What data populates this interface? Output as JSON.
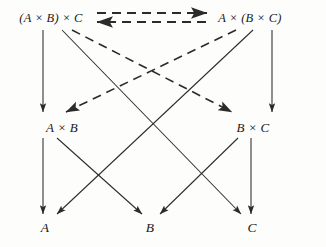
{
  "diagram": {
    "background_color": "#fdfdfc",
    "stroke_color": "#2b2b2b",
    "nodes": [
      {
        "id": "assoc-left",
        "label": "(A × B) × C",
        "x": 51,
        "y": 18
      },
      {
        "id": "assoc-right",
        "label": "A × (B × C)",
        "x": 250,
        "y": 18
      },
      {
        "id": "ab",
        "label": "A × B",
        "x": 45,
        "y": 126
      },
      {
        "id": "bc",
        "label": "B × C",
        "x": 250,
        "y": 126
      },
      {
        "id": "a",
        "label": "A",
        "x": 45,
        "y": 227
      },
      {
        "id": "b",
        "label": "B",
        "x": 150,
        "y": 227
      },
      {
        "id": "c",
        "label": "C",
        "x": 251,
        "y": 227
      }
    ],
    "edges": [
      {
        "id": "iso-forward",
        "from": "assoc-left",
        "to": "assoc-right",
        "style": "dashed",
        "arrow": "end"
      },
      {
        "id": "iso-backward",
        "from": "assoc-right",
        "to": "assoc-left",
        "style": "dashed",
        "arrow": "end"
      },
      {
        "id": "left-to-ab",
        "from": "assoc-left",
        "to": "ab",
        "style": "solid",
        "arrow": "end"
      },
      {
        "id": "right-to-bc",
        "from": "assoc-right",
        "to": "bc",
        "style": "solid",
        "arrow": "end"
      },
      {
        "id": "left-to-c",
        "from": "assoc-left",
        "to": "c",
        "style": "solid",
        "arrow": "end"
      },
      {
        "id": "right-to-a",
        "from": "assoc-right",
        "to": "a",
        "style": "solid",
        "arrow": "end"
      },
      {
        "id": "left-to-bc",
        "from": "assoc-left",
        "to": "bc",
        "style": "dashed",
        "arrow": "end"
      },
      {
        "id": "right-to-ab",
        "from": "assoc-right",
        "to": "ab",
        "style": "dashed",
        "arrow": "end"
      },
      {
        "id": "ab-to-a",
        "from": "ab",
        "to": "a",
        "style": "solid",
        "arrow": "end"
      },
      {
        "id": "ab-to-b",
        "from": "ab",
        "to": "b",
        "style": "solid",
        "arrow": "end"
      },
      {
        "id": "bc-to-b",
        "from": "bc",
        "to": "b",
        "style": "solid",
        "arrow": "end"
      },
      {
        "id": "bc-to-c",
        "from": "bc",
        "to": "c",
        "style": "solid",
        "arrow": "end"
      }
    ],
    "iso_arrows": {
      "forward": {
        "x1": 97,
        "y1": 13,
        "x2": 208,
        "y2": 13
      },
      "backward": {
        "x1": 206,
        "y1": 22,
        "x2": 96,
        "y2": 22
      }
    }
  }
}
